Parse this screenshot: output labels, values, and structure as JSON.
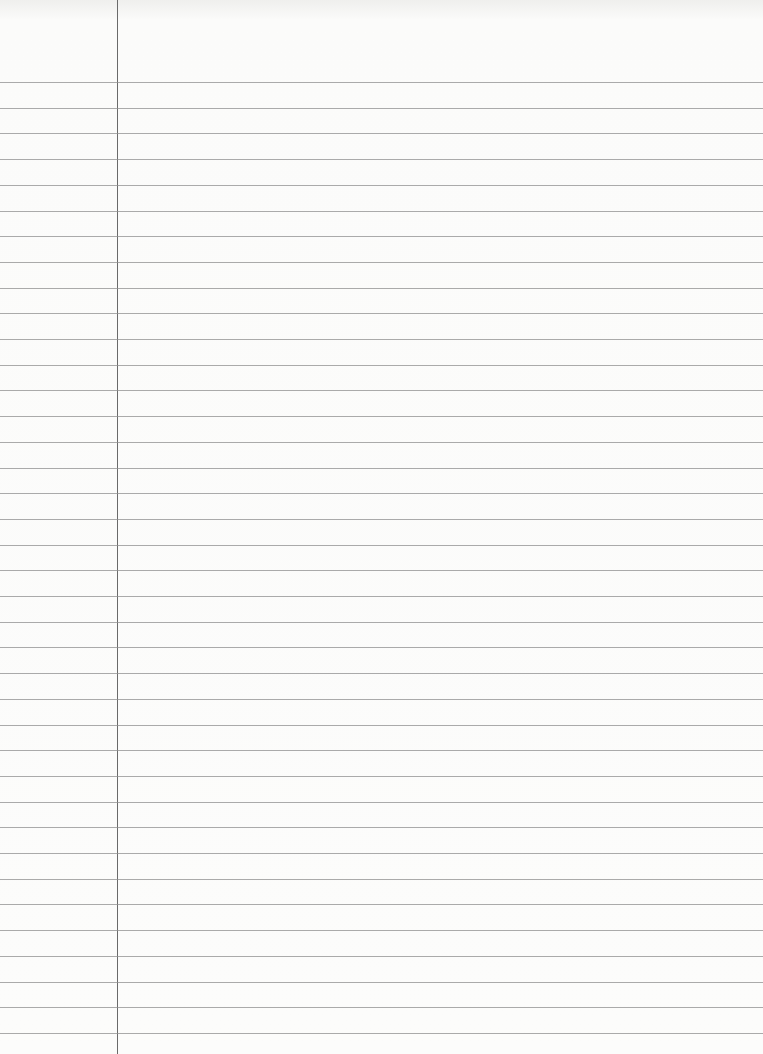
{
  "paper": {
    "type": "lined notebook paper",
    "first_rule_y": 82,
    "rule_spacing": 25.7,
    "rule_count": 38,
    "margin_x": 117,
    "rule_color": "#8f8f8f",
    "margin_color": "#6a6a6a",
    "background": "#fbfbfa"
  }
}
